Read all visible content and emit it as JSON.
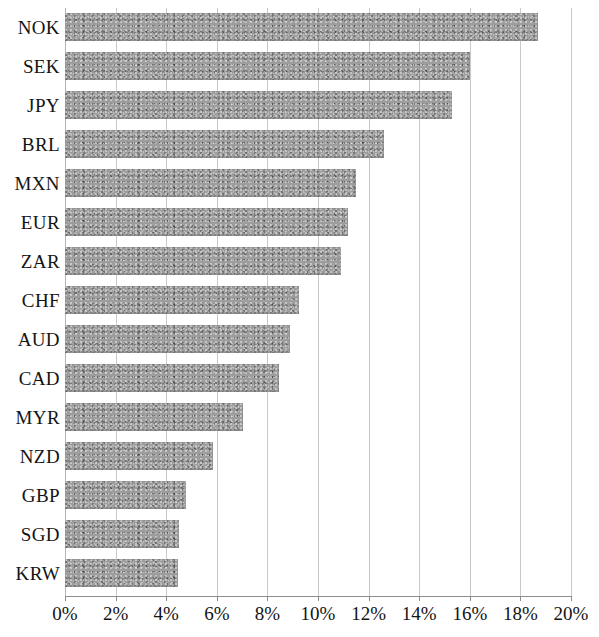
{
  "chart_data": {
    "type": "bar",
    "orientation": "horizontal",
    "title": "",
    "subtitle": "",
    "xlabel": "",
    "ylabel": "",
    "categories": [
      "NOK",
      "SEK",
      "JPY",
      "BRL",
      "MXN",
      "EUR",
      "ZAR",
      "CHF",
      "AUD",
      "CAD",
      "MYR",
      "NZD",
      "GBP",
      "SGD",
      "KRW"
    ],
    "values": [
      18.7,
      16.0,
      15.3,
      12.6,
      11.5,
      11.2,
      10.9,
      9.25,
      8.9,
      8.45,
      7.05,
      5.85,
      4.8,
      4.5,
      4.45
    ],
    "value_unit": "%",
    "xlim": [
      0,
      20
    ],
    "x_tick_values": [
      0,
      2,
      4,
      6,
      8,
      10,
      12,
      14,
      16,
      18,
      20
    ],
    "x_tick_labels": [
      "0%",
      "2%",
      "4%",
      "6%",
      "8%",
      "10%",
      "12%",
      "14%",
      "16%",
      "18%",
      "20%"
    ],
    "grid": true,
    "grid_axis": "x",
    "legend": false,
    "legend_position": "none",
    "series": [
      {
        "name": "",
        "values": [
          18.7,
          16.0,
          15.3,
          12.6,
          11.5,
          11.2,
          10.9,
          9.25,
          8.9,
          8.45,
          7.05,
          5.85,
          4.8,
          4.5,
          4.45
        ]
      }
    ],
    "colors": {
      "bar_fill": "#9d9d9d",
      "gridline": "#c9c9c9",
      "axis_line": "#8d8d8d",
      "text": "#141414",
      "background": "#ffffff"
    }
  }
}
